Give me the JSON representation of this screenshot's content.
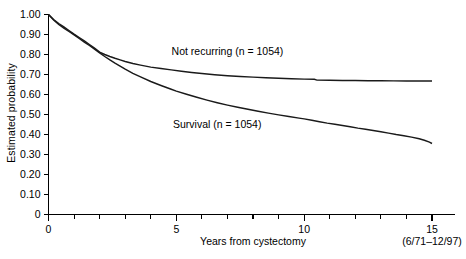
{
  "chart_data": {
    "type": "line",
    "title": "",
    "xlabel": "Years from cystectomy",
    "ylabel": "Estimated probability",
    "xlim": [
      0,
      15
    ],
    "ylim": [
      0,
      1.0
    ],
    "grid": false,
    "legend": "inline-annotations",
    "annotation": "(6/71–12/97)",
    "xticks": [
      0,
      1,
      2,
      3,
      4,
      5,
      6,
      7,
      8,
      9,
      10,
      11,
      12,
      13,
      14,
      15
    ],
    "xtick_labels": {
      "0": "0",
      "5": "5",
      "10": "10",
      "15": "15"
    },
    "yticks": [
      0,
      0.1,
      0.2,
      0.3,
      0.4,
      0.5,
      0.6,
      0.7,
      0.8,
      0.9,
      1.0
    ],
    "ytick_labels": [
      "0",
      "0.10",
      "0.20",
      "0.30",
      "0.40",
      "0.50",
      "0.60",
      "0.70",
      "0.80",
      "0.90",
      "1.00"
    ],
    "series": [
      {
        "name": "Not recurring (n = 1054)",
        "label": "Not recurring (n = 1054)",
        "n": 1054,
        "color": "#1a1a1a",
        "label_x": 7.0,
        "label_y": 0.8,
        "points": [
          [
            0.0,
            1.0
          ],
          [
            0.2,
            0.975
          ],
          [
            0.4,
            0.955
          ],
          [
            0.6,
            0.938
          ],
          [
            0.8,
            0.92
          ],
          [
            1.0,
            0.902
          ],
          [
            1.2,
            0.885
          ],
          [
            1.4,
            0.868
          ],
          [
            1.6,
            0.85
          ],
          [
            1.8,
            0.832
          ],
          [
            2.0,
            0.812
          ],
          [
            2.2,
            0.8
          ],
          [
            2.4,
            0.79
          ],
          [
            2.6,
            0.781
          ],
          [
            2.8,
            0.773
          ],
          [
            3.0,
            0.765
          ],
          [
            3.3,
            0.755
          ],
          [
            3.6,
            0.747
          ],
          [
            4.0,
            0.737
          ],
          [
            4.4,
            0.73
          ],
          [
            4.8,
            0.723
          ],
          [
            5.2,
            0.716
          ],
          [
            5.6,
            0.71
          ],
          [
            6.0,
            0.705
          ],
          [
            6.5,
            0.699
          ],
          [
            7.0,
            0.694
          ],
          [
            7.5,
            0.69
          ],
          [
            8.0,
            0.687
          ],
          [
            8.5,
            0.684
          ],
          [
            9.0,
            0.681
          ],
          [
            9.5,
            0.679
          ],
          [
            10.0,
            0.677
          ],
          [
            10.4,
            0.676
          ],
          [
            10.5,
            0.672
          ],
          [
            11.0,
            0.671
          ],
          [
            11.5,
            0.67
          ],
          [
            12.0,
            0.67
          ],
          [
            12.5,
            0.669
          ],
          [
            13.0,
            0.669
          ],
          [
            13.5,
            0.668
          ],
          [
            14.0,
            0.668
          ],
          [
            14.5,
            0.668
          ],
          [
            15.0,
            0.668
          ]
        ]
      },
      {
        "name": "Survival (n = 1054)",
        "label": "Survival (n = 1054)",
        "n": 1054,
        "color": "#1a1a1a",
        "label_x": 6.6,
        "label_y": 0.435,
        "points": [
          [
            0.0,
            1.0
          ],
          [
            0.2,
            0.972
          ],
          [
            0.4,
            0.95
          ],
          [
            0.6,
            0.932
          ],
          [
            0.8,
            0.915
          ],
          [
            1.0,
            0.898
          ],
          [
            1.2,
            0.88
          ],
          [
            1.4,
            0.862
          ],
          [
            1.6,
            0.845
          ],
          [
            1.8,
            0.827
          ],
          [
            2.0,
            0.808
          ],
          [
            2.2,
            0.79
          ],
          [
            2.4,
            0.773
          ],
          [
            2.6,
            0.757
          ],
          [
            2.8,
            0.742
          ],
          [
            3.0,
            0.727
          ],
          [
            3.3,
            0.706
          ],
          [
            3.6,
            0.688
          ],
          [
            4.0,
            0.665
          ],
          [
            4.4,
            0.645
          ],
          [
            4.8,
            0.626
          ],
          [
            5.0,
            0.617
          ],
          [
            5.4,
            0.601
          ],
          [
            5.8,
            0.586
          ],
          [
            6.2,
            0.572
          ],
          [
            6.6,
            0.559
          ],
          [
            7.0,
            0.547
          ],
          [
            7.4,
            0.536
          ],
          [
            7.8,
            0.526
          ],
          [
            8.2,
            0.516
          ],
          [
            8.6,
            0.507
          ],
          [
            9.0,
            0.498
          ],
          [
            9.4,
            0.49
          ],
          [
            9.8,
            0.482
          ],
          [
            10.0,
            0.478
          ],
          [
            10.3,
            0.471
          ],
          [
            10.6,
            0.464
          ],
          [
            10.9,
            0.457
          ],
          [
            11.2,
            0.451
          ],
          [
            11.5,
            0.445
          ],
          [
            11.8,
            0.439
          ],
          [
            12.1,
            0.432
          ],
          [
            12.4,
            0.426
          ],
          [
            12.7,
            0.42
          ],
          [
            13.0,
            0.414
          ],
          [
            13.3,
            0.407
          ],
          [
            13.6,
            0.4
          ],
          [
            13.9,
            0.394
          ],
          [
            14.2,
            0.387
          ],
          [
            14.5,
            0.379
          ],
          [
            14.7,
            0.371
          ],
          [
            14.9,
            0.362
          ],
          [
            15.0,
            0.355
          ]
        ]
      }
    ]
  }
}
